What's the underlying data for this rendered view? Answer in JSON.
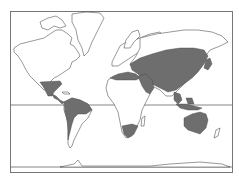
{
  "map": {
    "type": "world-distribution-map",
    "projection": "Mercator-like",
    "colors": {
      "background": "#ffffff",
      "land_outline": "#333333",
      "range_fill": "#6e6e6e",
      "frame": "#777777"
    },
    "reference_lines": [
      "equator",
      "antarctic-edge"
    ],
    "shaded_regions": [
      "southern-north-america-mexico",
      "central-america-caribbean",
      "northern-south-america",
      "north-africa-mediterranean",
      "middle-east-arabia",
      "central-and-east-asia",
      "southeast-asia-indonesia",
      "southern-africa-tip",
      "australia"
    ]
  }
}
